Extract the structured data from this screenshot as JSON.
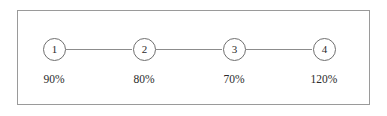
{
  "diagram": {
    "title": "",
    "style": {
      "border_color": "#9a9a9a",
      "node_stroke": "#6f6f6f",
      "edge_color": "#8c8c8c",
      "text_color": "#2b2b2b",
      "background": "#ffffff"
    },
    "nodes": [
      {
        "id": "1",
        "label": "1",
        "value": "90%",
        "cx": 53,
        "cy": 49
      },
      {
        "id": "2",
        "label": "2",
        "value": "80%",
        "cx": 143,
        "cy": 49
      },
      {
        "id": "3",
        "label": "3",
        "value": "70%",
        "cx": 233,
        "cy": 49
      },
      {
        "id": "4",
        "label": "4",
        "value": "120%",
        "cx": 323,
        "cy": 49
      }
    ],
    "edges": [
      {
        "from": "1",
        "to": "2",
        "x": 65,
        "y": 49,
        "width": 66
      },
      {
        "from": "2",
        "to": "3",
        "x": 155,
        "y": 49,
        "width": 66
      },
      {
        "from": "3",
        "to": "4",
        "x": 245,
        "y": 49,
        "width": 66
      }
    ]
  }
}
